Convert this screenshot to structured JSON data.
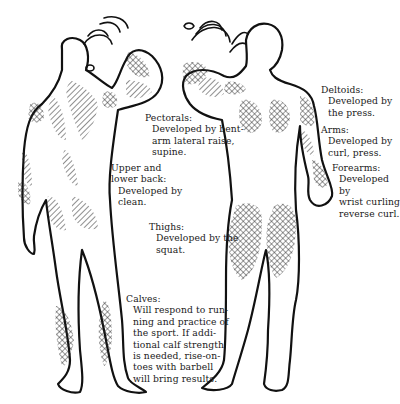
{
  "diagram": {
    "figures": [
      {
        "id": "back-view",
        "description": "Rear view of male figure pressing a dumbbell overhead"
      },
      {
        "id": "front-view",
        "description": "Front view of male figure pressing a dumbbell overhead"
      }
    ],
    "labels": [
      {
        "id": "pectorals",
        "title": "Pectorals:",
        "lines": [
          "Developed by bent-",
          "arm lateral raise,",
          "supine."
        ]
      },
      {
        "id": "deltoids",
        "title": "Deltoids:",
        "lines": [
          "Developed by",
          "the press."
        ]
      },
      {
        "id": "arms",
        "title": "Arms:",
        "lines": [
          "Developed by",
          "curl, press."
        ]
      },
      {
        "id": "forearms",
        "title": "Forearms:",
        "lines": [
          "Developed by",
          "wrist curling",
          "reverse curl."
        ]
      },
      {
        "id": "upper-lower-back",
        "title": "Upper and",
        "title2": "lower back:",
        "lines": [
          "Developed by",
          "clean."
        ]
      },
      {
        "id": "thighs",
        "title": "Thighs:",
        "lines": [
          "Developed by the",
          "squat."
        ]
      },
      {
        "id": "calves",
        "title": "Calves:",
        "lines": [
          "Will respond to run-",
          "ning and practice of",
          "the sport.  If addi-",
          "tional calf strength",
          "is needed, rise-on-",
          "toes with barbell",
          "will bring results."
        ]
      }
    ],
    "colors": {
      "ink": "#111111",
      "paper": "#ffffff"
    }
  }
}
